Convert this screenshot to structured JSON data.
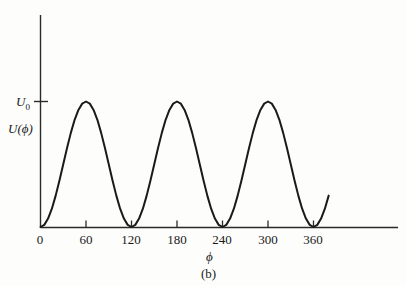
{
  "caption": "(b)",
  "axes": {
    "x_label": "ϕ",
    "y_label_function": "U(ϕ)",
    "y_label_max": "U",
    "y_label_max_sub": "0"
  },
  "chart_data": {
    "type": "line",
    "title": "",
    "subtitle": "",
    "xlabel": "ϕ",
    "ylabel": "U(ϕ)",
    "caption": "(b)",
    "xlim": [
      0,
      390
    ],
    "ylim": [
      0,
      1.18
    ],
    "grid": false,
    "legend": null,
    "xticks": [
      0,
      60,
      120,
      180,
      240,
      300,
      360
    ],
    "xticklabels": [
      "0",
      "60",
      "120",
      "180",
      "240",
      "300",
      "360"
    ],
    "yticks": [
      1.0
    ],
    "yticklabels": [
      "U₀"
    ],
    "line_color": "#1a1a1a",
    "line_width": 2.0,
    "series": [
      {
        "name": "U(ϕ)",
        "period_deg": 120,
        "amplitude": 1.0,
        "formula": "U0 * sin^2(3*ϕ/2)",
        "x": [
          0,
          5,
          10,
          15,
          20,
          25,
          30,
          35,
          40,
          45,
          50,
          55,
          60,
          65,
          70,
          75,
          80,
          85,
          90,
          95,
          100,
          105,
          110,
          115,
          120,
          125,
          130,
          135,
          140,
          145,
          150,
          155,
          160,
          165,
          170,
          175,
          180,
          185,
          190,
          195,
          200,
          205,
          210,
          215,
          220,
          225,
          230,
          235,
          240,
          245,
          250,
          255,
          260,
          265,
          270,
          275,
          280,
          285,
          290,
          295,
          300,
          305,
          310,
          315,
          320,
          325,
          330,
          335,
          340,
          345,
          350,
          355,
          360,
          365,
          370,
          375,
          380
        ],
        "y": [
          0.0,
          0.017,
          0.067,
          0.146,
          0.25,
          0.37,
          0.5,
          0.63,
          0.75,
          0.854,
          0.933,
          0.983,
          1.0,
          0.983,
          0.933,
          0.854,
          0.75,
          0.63,
          0.5,
          0.37,
          0.25,
          0.146,
          0.067,
          0.017,
          0.0,
          0.017,
          0.067,
          0.146,
          0.25,
          0.37,
          0.5,
          0.63,
          0.75,
          0.854,
          0.933,
          0.983,
          1.0,
          0.983,
          0.933,
          0.854,
          0.75,
          0.63,
          0.5,
          0.37,
          0.25,
          0.146,
          0.067,
          0.017,
          0.0,
          0.017,
          0.067,
          0.146,
          0.25,
          0.37,
          0.5,
          0.63,
          0.75,
          0.854,
          0.933,
          0.983,
          1.0,
          0.983,
          0.933,
          0.854,
          0.75,
          0.63,
          0.5,
          0.37,
          0.25,
          0.146,
          0.067,
          0.017,
          0.0,
          0.017,
          0.067,
          0.146,
          0.25
        ]
      }
    ]
  }
}
